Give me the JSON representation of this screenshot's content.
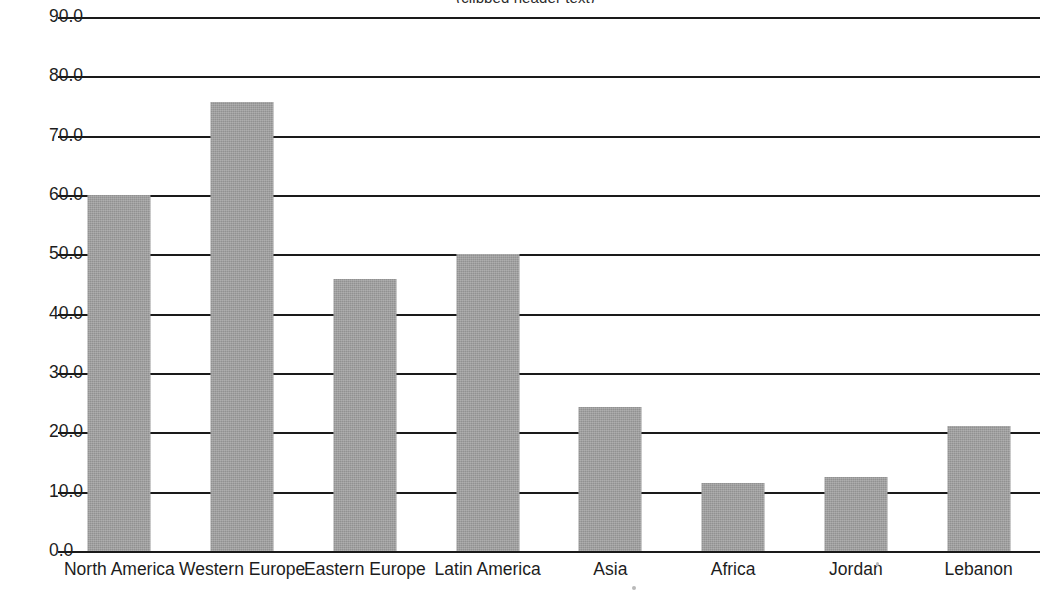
{
  "chart_data": {
    "type": "bar",
    "title": "(clipped header text)",
    "xlabel": "",
    "ylabel": "",
    "categories": [
      "North America",
      "Western Europe",
      "Eastern Europe",
      "Latin America",
      "Asia",
      "Africa",
      "Jordan",
      "Lebanon"
    ],
    "values": [
      60.0,
      75.6,
      45.8,
      50.0,
      24.3,
      11.4,
      12.4,
      21.0
    ],
    "ylim": [
      0,
      90
    ],
    "ytick_labels": [
      "90.0",
      "80.0",
      "70.0",
      "60.0",
      "50.0",
      "40.0",
      "30.0",
      "20.0",
      "10.0",
      "0.0"
    ],
    "ytick_values": [
      90,
      80,
      70,
      60,
      50,
      40,
      30,
      20,
      10,
      0
    ],
    "grid": true,
    "legend": "none",
    "bar_color": "#919191",
    "grid_color": "#1a1a1a",
    "text_color": "#1d1d1d"
  }
}
